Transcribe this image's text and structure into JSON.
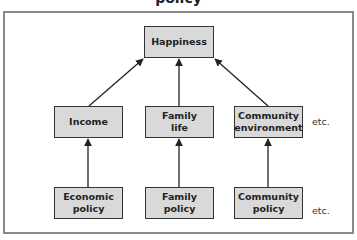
{
  "title_fragment": "policy",
  "nodes": {
    "top": {
      "label": "Happiness"
    },
    "middle": [
      {
        "label": "Income"
      },
      {
        "label": "Family life"
      },
      {
        "label": "Community environment"
      }
    ],
    "bottom": [
      {
        "label": "Economic policy"
      },
      {
        "label": "Family policy"
      },
      {
        "label": "Community policy"
      }
    ]
  },
  "etc_labels": [
    "etc.",
    "etc."
  ],
  "colors": {
    "box_fill": "#d9d9d9",
    "box_border": "#333333",
    "frame": "#8a8a8a",
    "arrow": "#222222"
  }
}
